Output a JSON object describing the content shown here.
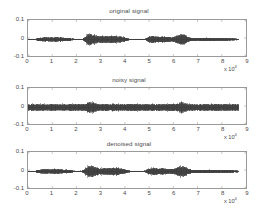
{
  "figure": {
    "background": "#ffffff",
    "signal_color": "#3a3a3a",
    "axis_color": "#9a9a9a",
    "text_color": "#4a4a4a",
    "exponent_label": "x 10",
    "exponent_power": "4"
  },
  "chart_data": [
    {
      "type": "line",
      "title": "original signal",
      "xlabel": "",
      "ylabel": "",
      "xlim": [
        0,
        9
      ],
      "ylim": [
        -0.1,
        0.1
      ],
      "x_multiplier": "x 10^4",
      "xticks": [
        0,
        1,
        2,
        3,
        4,
        5,
        6,
        7,
        8,
        9
      ],
      "xticklabels": [
        "0",
        "1",
        "2",
        "3",
        "4",
        "5",
        "6",
        "7",
        "8",
        "9"
      ],
      "yticks": [
        -0.1,
        0,
        0.1
      ],
      "yticklabels": [
        "-0.1",
        "0",
        "0.1"
      ],
      "grid": false,
      "legend": null,
      "data_extent_x": [
        0,
        8.7
      ],
      "baseline_offset": -0.008,
      "noise_floor": 0.0,
      "envelope": {
        "description": "speech-like burst envelope, amplitude vs x in units of 10^4",
        "x": [
          0.0,
          0.3,
          0.5,
          0.7,
          0.9,
          1.1,
          1.3,
          1.5,
          1.7,
          1.9,
          2.1,
          2.25,
          2.35,
          2.45,
          2.55,
          2.65,
          2.8,
          2.95,
          3.05,
          3.2,
          3.35,
          3.5,
          3.65,
          3.8,
          3.95,
          4.05,
          4.2,
          4.35,
          4.6,
          4.85,
          4.95,
          5.1,
          5.25,
          5.4,
          5.5,
          5.65,
          5.8,
          5.95,
          6.1,
          6.25,
          6.35,
          6.45,
          6.6,
          6.75,
          6.9,
          7.1,
          7.3,
          7.5,
          7.7,
          7.9,
          8.1,
          8.3,
          8.5,
          8.7
        ],
        "amplitude": [
          0.004,
          0.005,
          0.013,
          0.016,
          0.014,
          0.017,
          0.016,
          0.013,
          0.011,
          0.006,
          0.004,
          0.006,
          0.018,
          0.036,
          0.041,
          0.038,
          0.03,
          0.021,
          0.026,
          0.025,
          0.024,
          0.026,
          0.025,
          0.022,
          0.018,
          0.012,
          0.006,
          0.004,
          0.004,
          0.006,
          0.018,
          0.026,
          0.024,
          0.021,
          0.023,
          0.021,
          0.018,
          0.016,
          0.023,
          0.035,
          0.038,
          0.034,
          0.02,
          0.012,
          0.01,
          0.011,
          0.012,
          0.012,
          0.011,
          0.01,
          0.01,
          0.009,
          0.008,
          0.006
        ]
      }
    },
    {
      "type": "line",
      "title": "noisy signal",
      "xlabel": "",
      "ylabel": "",
      "xlim": [
        0,
        9
      ],
      "ylim": [
        -0.1,
        0.1
      ],
      "x_multiplier": "x 10^4",
      "xticks": [
        0,
        1,
        2,
        3,
        4,
        5,
        6,
        7,
        8,
        9
      ],
      "xticklabels": [
        "0",
        "1",
        "2",
        "3",
        "4",
        "5",
        "6",
        "7",
        "8",
        "9"
      ],
      "yticks": [
        -0.1,
        0,
        0.1
      ],
      "yticklabels": [
        "-0.1",
        "0",
        "0.1"
      ],
      "grid": false,
      "legend": null,
      "data_extent_x": [
        0,
        8.7
      ],
      "baseline_offset": -0.008,
      "noise_floor": 0.024,
      "envelope": {
        "description": "same burst envelope as original plus broadband additive noise floor",
        "x": [
          0.0,
          0.3,
          0.5,
          0.7,
          0.9,
          1.1,
          1.3,
          1.5,
          1.7,
          1.9,
          2.1,
          2.25,
          2.35,
          2.45,
          2.55,
          2.65,
          2.8,
          2.95,
          3.05,
          3.2,
          3.35,
          3.5,
          3.65,
          3.8,
          3.95,
          4.05,
          4.2,
          4.35,
          4.6,
          4.85,
          4.95,
          5.1,
          5.25,
          5.4,
          5.5,
          5.65,
          5.8,
          5.95,
          6.1,
          6.25,
          6.35,
          6.45,
          6.6,
          6.75,
          6.9,
          7.1,
          7.3,
          7.5,
          7.7,
          7.9,
          8.1,
          8.3,
          8.5,
          8.7
        ],
        "amplitude": [
          0.004,
          0.005,
          0.013,
          0.016,
          0.014,
          0.017,
          0.016,
          0.013,
          0.011,
          0.006,
          0.004,
          0.006,
          0.018,
          0.036,
          0.041,
          0.038,
          0.03,
          0.021,
          0.026,
          0.025,
          0.024,
          0.026,
          0.025,
          0.022,
          0.018,
          0.012,
          0.006,
          0.004,
          0.004,
          0.006,
          0.018,
          0.026,
          0.024,
          0.021,
          0.023,
          0.021,
          0.018,
          0.016,
          0.023,
          0.035,
          0.038,
          0.034,
          0.02,
          0.012,
          0.01,
          0.011,
          0.012,
          0.012,
          0.011,
          0.01,
          0.01,
          0.009,
          0.008,
          0.006
        ]
      }
    },
    {
      "type": "line",
      "title": "denoised signal",
      "xlabel": "",
      "ylabel": "",
      "xlim": [
        0,
        9
      ],
      "ylim": [
        -0.1,
        0.1
      ],
      "x_multiplier": "x 10^4",
      "xticks": [
        0,
        1,
        2,
        3,
        4,
        5,
        6,
        7,
        8,
        9
      ],
      "xticklabels": [
        "0",
        "1",
        "2",
        "3",
        "4",
        "5",
        "6",
        "7",
        "8",
        "9"
      ],
      "yticks": [
        -0.1,
        0,
        0.1
      ],
      "yticklabels": [
        "-0.1",
        "0",
        "0.1"
      ],
      "grid": false,
      "legend": null,
      "data_extent_x": [
        0,
        8.7
      ],
      "baseline_offset": -0.008,
      "noise_floor": 0.0015,
      "envelope": {
        "description": "recovered burst envelope, close to original with slight residual",
        "x": [
          0.0,
          0.3,
          0.5,
          0.7,
          0.9,
          1.1,
          1.3,
          1.5,
          1.7,
          1.9,
          2.1,
          2.25,
          2.35,
          2.45,
          2.55,
          2.65,
          2.8,
          2.95,
          3.05,
          3.2,
          3.35,
          3.5,
          3.65,
          3.8,
          3.95,
          4.05,
          4.2,
          4.35,
          4.6,
          4.85,
          4.95,
          5.1,
          5.25,
          5.4,
          5.5,
          5.65,
          5.8,
          5.95,
          6.1,
          6.25,
          6.35,
          6.45,
          6.6,
          6.75,
          6.9,
          7.1,
          7.3,
          7.5,
          7.7,
          7.9,
          8.1,
          8.3,
          8.5,
          8.7
        ],
        "amplitude": [
          0.004,
          0.006,
          0.014,
          0.017,
          0.015,
          0.018,
          0.016,
          0.014,
          0.011,
          0.007,
          0.005,
          0.007,
          0.019,
          0.037,
          0.042,
          0.038,
          0.031,
          0.022,
          0.026,
          0.025,
          0.024,
          0.026,
          0.025,
          0.022,
          0.018,
          0.012,
          0.007,
          0.005,
          0.005,
          0.007,
          0.019,
          0.026,
          0.024,
          0.022,
          0.023,
          0.021,
          0.018,
          0.017,
          0.024,
          0.035,
          0.038,
          0.034,
          0.021,
          0.013,
          0.011,
          0.012,
          0.013,
          0.013,
          0.012,
          0.011,
          0.01,
          0.01,
          0.009,
          0.007
        ]
      }
    }
  ]
}
